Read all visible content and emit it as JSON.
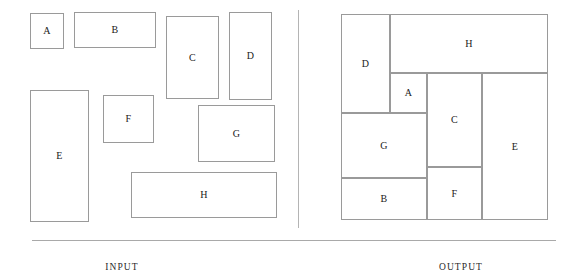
{
  "figure": {
    "width": 576,
    "height": 275,
    "background": "#ffffff",
    "stroke_color": "#9a9a9a",
    "text_color": "#1a1a1a",
    "divider_color": "#b4b4b4",
    "rule_color": "#a9a9a9"
  },
  "diagram_data": {
    "type": "rectangle-packing",
    "description": "Bin packing / rectangle packing illustration: eight labelled rectangles shown loose on the left (INPUT) and packed without gaps into a single bounding box on the right (OUTPUT).",
    "panels": [
      {
        "id": "input",
        "caption": "INPUT",
        "caption_x": 122,
        "caption_y": 268,
        "items": [
          {
            "label": "A",
            "x": 30,
            "y": 13,
            "w": 34,
            "h": 36
          },
          {
            "label": "B",
            "x": 74,
            "y": 12,
            "w": 82,
            "h": 36
          },
          {
            "label": "C",
            "x": 166,
            "y": 16,
            "w": 53,
            "h": 83
          },
          {
            "label": "D",
            "x": 229,
            "y": 12,
            "w": 43,
            "h": 88
          },
          {
            "label": "E",
            "x": 30,
            "y": 90,
            "w": 59,
            "h": 132
          },
          {
            "label": "F",
            "x": 103,
            "y": 95,
            "w": 51,
            "h": 48
          },
          {
            "label": "G",
            "x": 198,
            "y": 105,
            "w": 77,
            "h": 57
          },
          {
            "label": "H",
            "x": 131,
            "y": 172,
            "w": 146,
            "h": 46
          }
        ]
      },
      {
        "id": "output",
        "caption": "OUTPUT",
        "caption_x": 461,
        "caption_y": 268,
        "bounding_box": {
          "x": 341,
          "y": 14,
          "w": 207,
          "h": 206
        },
        "items": [
          {
            "label": "D",
            "x": 341,
            "y": 14,
            "w": 49,
            "h": 99
          },
          {
            "label": "H",
            "x": 390,
            "y": 14,
            "w": 158,
            "h": 59
          },
          {
            "label": "A",
            "x": 390,
            "y": 73,
            "w": 37,
            "h": 40
          },
          {
            "label": "C",
            "x": 427,
            "y": 73,
            "w": 55,
            "h": 94
          },
          {
            "label": "E",
            "x": 482,
            "y": 73,
            "w": 66,
            "h": 147
          },
          {
            "label": "G",
            "x": 341,
            "y": 113,
            "w": 86,
            "h": 65
          },
          {
            "label": "F",
            "x": 427,
            "y": 167,
            "w": 55,
            "h": 53
          },
          {
            "label": "B",
            "x": 341,
            "y": 178,
            "w": 86,
            "h": 42
          }
        ]
      }
    ],
    "divider": {
      "x": 298,
      "y": 10,
      "height": 218
    },
    "rule": {
      "x": 32,
      "y": 240,
      "width": 524
    }
  }
}
